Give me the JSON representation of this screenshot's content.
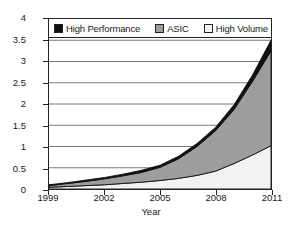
{
  "chart_data": {
    "type": "area",
    "stacked": true,
    "title": "",
    "xlabel": "Year",
    "ylabel": "Transistors (billions)",
    "x": [
      1999,
      2000,
      2001,
      2002,
      2003,
      2004,
      2005,
      2006,
      2007,
      2008,
      2009,
      2010,
      2011
    ],
    "xlim": [
      1999,
      2011
    ],
    "ylim": [
      0,
      4
    ],
    "xticks": [
      "1999",
      "2002",
      "2005",
      "2008",
      "2011"
    ],
    "xtick_values": [
      1999,
      2002,
      2005,
      2008,
      2011
    ],
    "yticks": [
      "0",
      "0.5",
      "1",
      "1.5",
      "2",
      "2.5",
      "3",
      "3.5",
      "4"
    ],
    "ytick_values": [
      0,
      0.5,
      1,
      1.5,
      2,
      2.5,
      3,
      3.5,
      4
    ],
    "grid": "horizontal",
    "legend_position": "top-inside",
    "series": [
      {
        "name": "High Volume",
        "color": "#f2f2f2",
        "stack_order": 1,
        "values": [
          0.04,
          0.06,
          0.08,
          0.1,
          0.13,
          0.16,
          0.2,
          0.25,
          0.32,
          0.42,
          0.6,
          0.8,
          1.02
        ]
      },
      {
        "name": "ASIC",
        "color": "#9d9d9d",
        "stack_order": 2,
        "values": [
          0.04,
          0.07,
          0.1,
          0.14,
          0.18,
          0.23,
          0.31,
          0.46,
          0.68,
          0.95,
          1.27,
          1.73,
          2.23
        ]
      },
      {
        "name": "High Performance",
        "color": "#111111",
        "stack_order": 3,
        "values": [
          0.02,
          0.02,
          0.03,
          0.03,
          0.04,
          0.05,
          0.05,
          0.06,
          0.07,
          0.08,
          0.11,
          0.15,
          0.25
        ]
      }
    ],
    "cumulative_totals": [
      0.1,
      0.15,
      0.21,
      0.27,
      0.35,
      0.44,
      0.56,
      0.77,
      1.07,
      1.45,
      1.98,
      2.68,
      3.5
    ],
    "cumulative_high_volume_plus_asic": [
      0.08,
      0.13,
      0.18,
      0.24,
      0.31,
      0.39,
      0.51,
      0.71,
      1.0,
      1.37,
      1.87,
      2.53,
      3.25
    ]
  },
  "axes": {
    "y_title": "Transistors (billions)",
    "x_title": "Year"
  },
  "legend": {
    "entries": [
      {
        "label": "High Performance",
        "swatch": "hp"
      },
      {
        "label": "ASIC",
        "swatch": "asic"
      },
      {
        "label": "High Volume",
        "swatch": "hv"
      }
    ]
  }
}
